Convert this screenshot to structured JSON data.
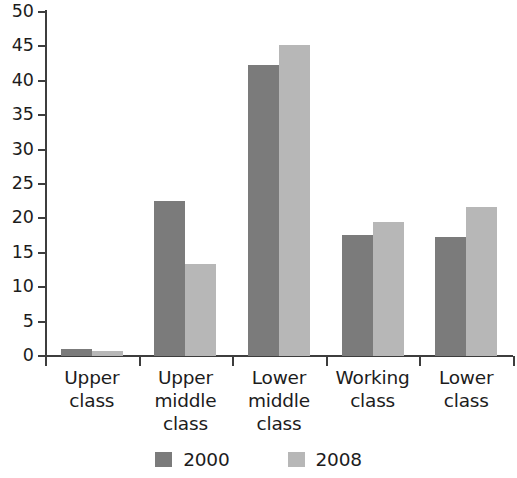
{
  "chart_data": {
    "type": "bar",
    "title": "",
    "subtitle": "",
    "xlabel": "",
    "ylabel": "",
    "categories": [
      "Upper\nclass",
      "Upper\nmiddle\nclass",
      "Lower\nmiddle\nclass",
      "Working\nclass",
      "Lower\nclass"
    ],
    "series": [
      {
        "name": "2000",
        "color": "#7b7b7b",
        "values": [
          1.0,
          22.5,
          42.3,
          17.6,
          17.3
        ]
      },
      {
        "name": "2008",
        "color": "#b7b7b7",
        "values": [
          0.8,
          13.4,
          45.2,
          19.5,
          21.7
        ]
      }
    ],
    "ylim": [
      0,
      50
    ],
    "yticks": [
      0,
      5,
      10,
      15,
      20,
      25,
      30,
      35,
      40,
      45,
      50
    ],
    "ytick_labels": [
      "0",
      "5",
      "10",
      "15",
      "20",
      "25",
      "30",
      "35",
      "40",
      "45",
      "50"
    ],
    "grid": false,
    "legend_position": "bottom",
    "legend": [
      "2000",
      "2008"
    ]
  },
  "axes": {
    "y_axis_name": "y-axis",
    "x_axis_name": "x-axis"
  }
}
